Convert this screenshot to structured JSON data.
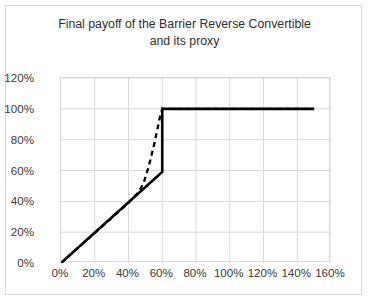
{
  "chart_data": {
    "type": "line",
    "title": "Final payoff of the Barrier Reverse Convertible and its proxy",
    "title_line1": "Final payoff of the Barrier Reverse Convertible",
    "title_line2": "and its proxy",
    "xlabel": "",
    "ylabel": "",
    "xlim": [
      0,
      160
    ],
    "ylim": [
      0,
      120
    ],
    "xticks": [
      "0%",
      "20%",
      "40%",
      "60%",
      "80%",
      "100%",
      "120%",
      "140%",
      "160%"
    ],
    "xtick_values": [
      0,
      20,
      40,
      60,
      80,
      100,
      120,
      140,
      160
    ],
    "yticks": [
      "0%",
      "20%",
      "40%",
      "60%",
      "80%",
      "100%",
      "120%"
    ],
    "ytick_values": [
      0,
      20,
      40,
      60,
      80,
      100,
      120
    ],
    "grid": true,
    "legend": "none",
    "series": [
      {
        "name": "Barrier Reverse Convertible payoff",
        "style": "solid",
        "color": "#000000",
        "width": 2.6,
        "points": [
          [
            0,
            0
          ],
          [
            60,
            59
          ],
          [
            60,
            100
          ],
          [
            150,
            100
          ]
        ]
      },
      {
        "name": "Proxy payoff",
        "style": "dashed",
        "color": "#000000",
        "width": 2.3,
        "dash": "5,4",
        "points": [
          [
            0,
            0
          ],
          [
            40,
            39
          ],
          [
            46,
            46
          ],
          [
            49,
            52
          ],
          [
            51,
            59
          ],
          [
            53,
            67
          ],
          [
            55,
            76
          ],
          [
            57,
            86
          ],
          [
            58.5,
            94
          ],
          [
            60,
            100
          ],
          [
            150,
            100
          ]
        ]
      }
    ]
  },
  "axis": {
    "y_tick_labels": [
      "120%",
      "100%",
      "80%",
      "60%",
      "40%",
      "20%",
      "0%"
    ],
    "x_tick_labels": [
      "0%",
      "20%",
      "40%",
      "60%",
      "80%",
      "100%",
      "120%",
      "140%",
      "160%"
    ]
  },
  "colors": {
    "line": "#000000",
    "grid": "#d9d9d9",
    "border": "#d8d8d8",
    "text": "#3a3a3a",
    "background": "#ffffff"
  }
}
